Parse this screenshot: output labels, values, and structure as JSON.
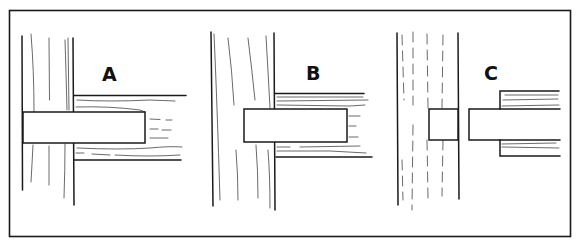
{
  "diagram": {
    "type": "woodworking-joint-illustration",
    "colors": {
      "ink": "#1a1a1a",
      "background": "#ffffff"
    },
    "panels": [
      {
        "id": "A",
        "label": "A",
        "state": "tenon fully inserted through post, rail shoulders against post"
      },
      {
        "id": "B",
        "label": "B",
        "state": "tenon inserted, rail against post"
      },
      {
        "id": "C",
        "label": "C",
        "state": "joint separated: mortise hole in post, tenon on rail pulled apart"
      }
    ]
  }
}
